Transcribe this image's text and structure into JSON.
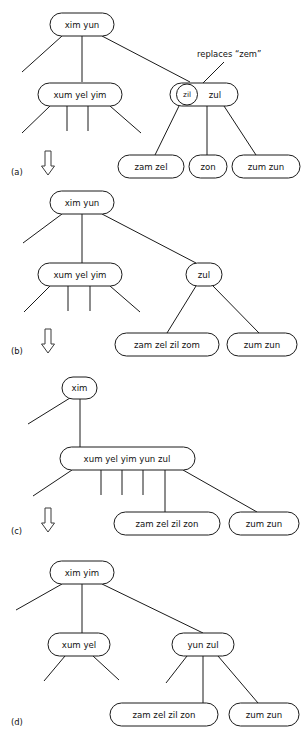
{
  "figure": {
    "type": "b-tree-node-split-sequence-diagram",
    "panels": [
      {
        "id": "a",
        "label": "(a)",
        "transition_arrow": "⇓",
        "annotation": {
          "text": "replaces “zem”",
          "target_node": "zil"
        },
        "nodes": [
          {
            "id": "a-root",
            "keys": [
              "xim",
              "yun"
            ],
            "highlight": null
          },
          {
            "id": "a-l1",
            "keys": [
              "xum",
              "yel",
              "yim"
            ],
            "highlight": null
          },
          {
            "id": "a-r1",
            "keys": [
              "zil",
              "zul"
            ],
            "highlight": "zil"
          },
          {
            "id": "a-leaf1",
            "keys": [
              "zam",
              "zel"
            ],
            "highlight": null
          },
          {
            "id": "a-leaf2",
            "keys": [
              "zon"
            ],
            "highlight": null
          },
          {
            "id": "a-leaf3",
            "keys": [
              "zum",
              "zun"
            ],
            "highlight": null
          }
        ]
      },
      {
        "id": "b",
        "label": "(b)",
        "transition_arrow": "⇓",
        "annotation": null,
        "nodes": [
          {
            "id": "b-root",
            "keys": [
              "xim",
              "yun"
            ],
            "highlight": null
          },
          {
            "id": "b-l1",
            "keys": [
              "xum",
              "yel",
              "yim"
            ],
            "highlight": null
          },
          {
            "id": "b-r1",
            "keys": [
              "zul"
            ],
            "highlight": null
          },
          {
            "id": "b-leaf1",
            "keys": [
              "zam",
              "zel",
              "zil",
              "zom"
            ],
            "highlight": null
          },
          {
            "id": "b-leaf2",
            "keys": [
              "zum",
              "zun"
            ],
            "highlight": null
          }
        ]
      },
      {
        "id": "c",
        "label": "(c)",
        "transition_arrow": "⇓",
        "annotation": null,
        "nodes": [
          {
            "id": "c-root",
            "keys": [
              "xim"
            ],
            "highlight": null
          },
          {
            "id": "c-l1",
            "keys": [
              "xum",
              "yel",
              "yim",
              "yun",
              "zul"
            ],
            "highlight": null
          },
          {
            "id": "c-leaf1",
            "keys": [
              "zam",
              "zel",
              "zil",
              "zon"
            ],
            "highlight": null
          },
          {
            "id": "c-leaf2",
            "keys": [
              "zum",
              "zun"
            ],
            "highlight": null
          }
        ]
      },
      {
        "id": "d",
        "label": "(d)",
        "transition_arrow": null,
        "annotation": null,
        "nodes": [
          {
            "id": "d-root",
            "keys": [
              "xim",
              "yim"
            ],
            "highlight": null
          },
          {
            "id": "d-l1",
            "keys": [
              "xum",
              "yel"
            ],
            "highlight": null
          },
          {
            "id": "d-r1",
            "keys": [
              "yun",
              "zul"
            ],
            "highlight": null
          },
          {
            "id": "d-leaf1",
            "keys": [
              "zam",
              "zel",
              "zil",
              "zon"
            ],
            "highlight": null
          },
          {
            "id": "d-leaf2",
            "keys": [
              "zum",
              "zun"
            ],
            "highlight": null
          }
        ]
      }
    ]
  },
  "labels": {
    "panel_a": "(a)",
    "panel_b": "(b)",
    "panel_c": "(c)",
    "panel_d": "(d)",
    "arrow_a": "⇓",
    "arrow_b": "⇓",
    "arrow_c": "⇓",
    "annotation_a": "replaces “zem”"
  },
  "node_text": {
    "a_root": "xim  yun",
    "a_l1": "xum   yel   yim",
    "a_r1_circle": "zil",
    "a_r1_rest": "zul",
    "a_leaf1": "zam   zel",
    "a_leaf2": "zon",
    "a_leaf3": "zum  zun",
    "b_root": "xim  yun",
    "b_l1": "xum   yel   yim",
    "b_r1": "zul",
    "b_leaf1": "zam  zel   zil  zom",
    "b_leaf2": "zum  zun",
    "c_root": "xim",
    "c_l1": "xum  yel   yim   yun   zul",
    "c_leaf1": "zam   zel   zil   zon",
    "c_leaf2": "zum  zun",
    "d_root": "xim  yim",
    "d_l1": "xum  yel",
    "d_r1": "yun   zul",
    "d_leaf1": "zam   zel   zil   zon",
    "d_leaf2": "zum  zun"
  },
  "style": {
    "stroke_color": "#1a1a1a",
    "text_color": "#111111",
    "background": "#ffffff",
    "arrow_color": "#3a3a3a"
  }
}
